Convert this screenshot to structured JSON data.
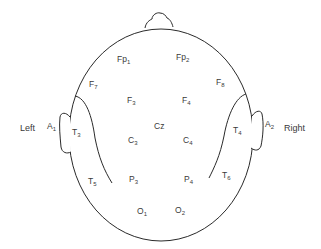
{
  "diagram": {
    "type": "EEG 10-20 electrode placement (top view of head)",
    "side_labels": {
      "left": "Left",
      "right": "Right"
    },
    "electrodes": [
      {
        "id": "fp1",
        "base": "Fp",
        "sub": "1",
        "x": 117,
        "y": 55
      },
      {
        "id": "fp2",
        "base": "Fp",
        "sub": "2",
        "x": 176,
        "y": 53
      },
      {
        "id": "f7",
        "base": "F",
        "sub": "7",
        "x": 89,
        "y": 80
      },
      {
        "id": "f8",
        "base": "F",
        "sub": "8",
        "x": 216,
        "y": 78
      },
      {
        "id": "f3",
        "base": "F",
        "sub": "3",
        "x": 127,
        "y": 96
      },
      {
        "id": "f4",
        "base": "F",
        "sub": "4",
        "x": 182,
        "y": 96
      },
      {
        "id": "cz",
        "base": "Cz",
        "sub": "",
        "x": 154,
        "y": 122
      },
      {
        "id": "c3",
        "base": "C",
        "sub": "3",
        "x": 128,
        "y": 136
      },
      {
        "id": "c4",
        "base": "C",
        "sub": "4",
        "x": 183,
        "y": 136
      },
      {
        "id": "a1",
        "base": "A",
        "sub": "1",
        "x": 47,
        "y": 122
      },
      {
        "id": "a2",
        "base": "A",
        "sub": "2",
        "x": 265,
        "y": 120
      },
      {
        "id": "t3",
        "base": "T",
        "sub": "3",
        "x": 72,
        "y": 128
      },
      {
        "id": "t4",
        "base": "T",
        "sub": "4",
        "x": 233,
        "y": 126
      },
      {
        "id": "t5",
        "base": "T",
        "sub": "5",
        "x": 88,
        "y": 177
      },
      {
        "id": "t6",
        "base": "T",
        "sub": "6",
        "x": 222,
        "y": 171
      },
      {
        "id": "p3",
        "base": "P",
        "sub": "3",
        "x": 129,
        "y": 175
      },
      {
        "id": "p4",
        "base": "P",
        "sub": "4",
        "x": 184,
        "y": 175
      },
      {
        "id": "o1",
        "base": "O",
        "sub": "1",
        "x": 137,
        "y": 207
      },
      {
        "id": "o2",
        "base": "O",
        "sub": "2",
        "x": 175,
        "y": 206
      }
    ],
    "colors": {
      "line": "#2a2a2a",
      "text": "#3a3a3a",
      "background": "#ffffff"
    }
  }
}
